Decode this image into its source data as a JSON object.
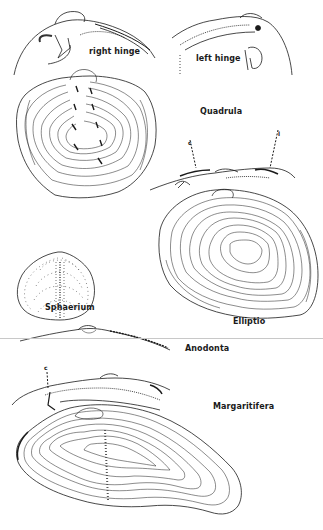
{
  "figure": {
    "labels": {
      "right_hinge": "right hinge",
      "left_hinge": "left hinge",
      "quadrula": "Quadrula",
      "cardinal_marker": "c",
      "lateral_marker": "l",
      "sphaerium": "Sphaerium",
      "elliptio": "Elliptio",
      "anodonta": "Anodonta",
      "margaritifera_marker": "c",
      "margaritifera": "Margaritifera"
    },
    "colors": {
      "ink": "#1a1a1a",
      "paper": "#ffffff",
      "divider": "#c8c8c8"
    }
  }
}
